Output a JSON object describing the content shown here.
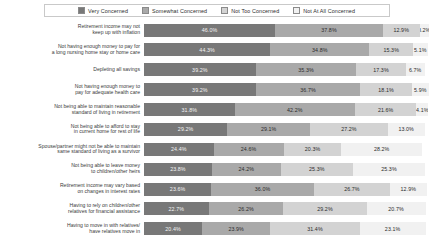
{
  "chart_data": {
    "type": "bar",
    "title": "",
    "subtitle": "",
    "xlabel": "",
    "ylabel": "",
    "orientation": "horizontal",
    "stacked": true,
    "normalized_percent": true,
    "xlim": [
      0,
      100
    ],
    "grid": false,
    "legend_position": "top-center",
    "legend": [
      "Very Concerned",
      "Somewhat Concerned",
      "Not Too Concerned",
      "Not At All Concerned"
    ],
    "colors": [
      "#787878",
      "#a9a9a9",
      "#d3d3d3",
      "#f1f1f1"
    ],
    "categories": [
      "Retirement income may not\nkeep up with inflation",
      "Not having enough money to pay for\na long nursing home stay or home care",
      "Depleting all savings",
      "Not having enough money to\npay for adequate health care",
      "Not being able to maintain reasonable\nstandard of living in retirement",
      "Not being able to afford to stay\nin current home for rest of life",
      "Spouse/partner might not be able to maintain\nsame standard of living as a survivor",
      "Not being able to leave money\nto children/other heirs",
      "Retirement income may vary based\non changes in interest rates",
      "Having to rely on children/other\nrelatives for financial assistance",
      "Having to move in with relatives/\nhave relatives move in"
    ],
    "series": [
      {
        "name": "Very Concerned",
        "values": [
          46.0,
          44.3,
          39.2,
          39.2,
          31.8,
          29.2,
          24.4,
          23.8,
          23.6,
          22.7,
          20.4
        ]
      },
      {
        "name": "Somewhat Concerned",
        "values": [
          37.8,
          34.8,
          35.3,
          36.7,
          42.2,
          29.1,
          24.6,
          24.2,
          36.0,
          26.2,
          23.9
        ]
      },
      {
        "name": "Not Too Concerned",
        "values": [
          12.9,
          15.3,
          17.3,
          18.1,
          21.6,
          27.2,
          20.3,
          25.3,
          26.7,
          29.2,
          31.4
        ]
      },
      {
        "name": "Not At All Concerned",
        "values": [
          3.2,
          5.1,
          6.7,
          5.9,
          4.1,
          13.0,
          28.2,
          25.3,
          12.9,
          20.7,
          23.1
        ]
      }
    ],
    "data_labels": [
      [
        "46.0%",
        "37.8%",
        "12.9%",
        "3.2%"
      ],
      [
        "44.3%",
        "34.8%",
        "15.3%",
        "5.1%"
      ],
      [
        "39.2%",
        "35.3%",
        "17.3%",
        "6.7%"
      ],
      [
        "39.2%",
        "36.7%",
        "18.1%",
        "5.9%"
      ],
      [
        "31.8%",
        "42.2%",
        "21.6%",
        "4.1%"
      ],
      [
        "29.2%",
        "29.1%",
        "27.2%",
        "13.0%"
      ],
      [
        "24.4%",
        "24.6%",
        "20.3%",
        "28.2%"
      ],
      [
        "23.8%",
        "24.2%",
        "25.3%",
        "25.3%"
      ],
      [
        "23.6%",
        "36.0%",
        "26.7%",
        "12.9%"
      ],
      [
        "22.7%",
        "26.2%",
        "29.2%",
        "20.7%"
      ],
      [
        "20.4%",
        "23.9%",
        "31.4%",
        "23.1%"
      ]
    ]
  }
}
